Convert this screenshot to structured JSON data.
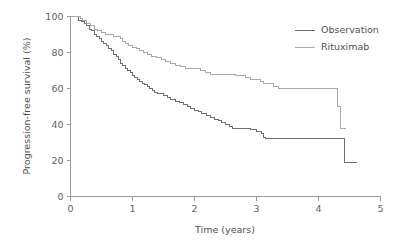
{
  "chart_data": {
    "type": "line",
    "subtype": "kaplan-meier-step",
    "title": "",
    "xlabel": "Time (years)",
    "ylabel": "Progression-free survival (%)",
    "xlim": [
      0,
      5
    ],
    "ylim": [
      0,
      100
    ],
    "xticks": [
      0,
      1,
      2,
      3,
      4,
      5
    ],
    "xtick_labels": [
      "0",
      "1",
      "2",
      "3",
      "4",
      "5"
    ],
    "yticks": [
      0,
      20,
      40,
      60,
      80,
      100
    ],
    "ytick_labels": [
      "0",
      "20",
      "40",
      "60",
      "80",
      "100"
    ],
    "grid": false,
    "legend_position": "top-right",
    "series": [
      {
        "name": "Observation",
        "color": "#6e6e6e",
        "final_value": 19,
        "points": [
          [
            0.0,
            100
          ],
          [
            0.1,
            100
          ],
          [
            0.13,
            98
          ],
          [
            0.18,
            97
          ],
          [
            0.22,
            96
          ],
          [
            0.26,
            95
          ],
          [
            0.3,
            93
          ],
          [
            0.34,
            92
          ],
          [
            0.38,
            90
          ],
          [
            0.42,
            89
          ],
          [
            0.46,
            88
          ],
          [
            0.5,
            86
          ],
          [
            0.54,
            85
          ],
          [
            0.58,
            84
          ],
          [
            0.62,
            82
          ],
          [
            0.66,
            81
          ],
          [
            0.7,
            79
          ],
          [
            0.74,
            78
          ],
          [
            0.78,
            76
          ],
          [
            0.8,
            74
          ],
          [
            0.84,
            73
          ],
          [
            0.88,
            71
          ],
          [
            0.92,
            70
          ],
          [
            0.96,
            69
          ],
          [
            1.0,
            67
          ],
          [
            1.04,
            66
          ],
          [
            1.08,
            65
          ],
          [
            1.12,
            64
          ],
          [
            1.16,
            63
          ],
          [
            1.2,
            62
          ],
          [
            1.24,
            61
          ],
          [
            1.28,
            60
          ],
          [
            1.32,
            59
          ],
          [
            1.36,
            58
          ],
          [
            1.4,
            57
          ],
          [
            1.5,
            56
          ],
          [
            1.56,
            55
          ],
          [
            1.62,
            54
          ],
          [
            1.7,
            53
          ],
          [
            1.76,
            52
          ],
          [
            1.82,
            51
          ],
          [
            1.88,
            50
          ],
          [
            1.94,
            49
          ],
          [
            2.0,
            48
          ],
          [
            2.06,
            47
          ],
          [
            2.12,
            46
          ],
          [
            2.2,
            45
          ],
          [
            2.26,
            44
          ],
          [
            2.32,
            43
          ],
          [
            2.38,
            42
          ],
          [
            2.44,
            41
          ],
          [
            2.5,
            40
          ],
          [
            2.56,
            39
          ],
          [
            2.62,
            38
          ],
          [
            2.8,
            38
          ],
          [
            2.9,
            37
          ],
          [
            3.0,
            36
          ],
          [
            3.08,
            35
          ],
          [
            3.12,
            33
          ],
          [
            3.15,
            32
          ],
          [
            4.3,
            32
          ],
          [
            4.4,
            32
          ],
          [
            4.42,
            19
          ],
          [
            4.62,
            19
          ]
        ]
      },
      {
        "name": "Rituximab",
        "color": "#a8a8a8",
        "final_value": 38,
        "points": [
          [
            0.0,
            100
          ],
          [
            0.12,
            100
          ],
          [
            0.16,
            99
          ],
          [
            0.2,
            98
          ],
          [
            0.26,
            96
          ],
          [
            0.32,
            95
          ],
          [
            0.38,
            93
          ],
          [
            0.44,
            92
          ],
          [
            0.5,
            91
          ],
          [
            0.56,
            90
          ],
          [
            0.62,
            90
          ],
          [
            0.7,
            89
          ],
          [
            0.76,
            89
          ],
          [
            0.8,
            88
          ],
          [
            0.84,
            86
          ],
          [
            0.88,
            85
          ],
          [
            0.94,
            84
          ],
          [
            1.0,
            83
          ],
          [
            1.06,
            82
          ],
          [
            1.12,
            81
          ],
          [
            1.18,
            80
          ],
          [
            1.24,
            79
          ],
          [
            1.3,
            78
          ],
          [
            1.38,
            77
          ],
          [
            1.46,
            76
          ],
          [
            1.54,
            75
          ],
          [
            1.62,
            74
          ],
          [
            1.7,
            73
          ],
          [
            1.78,
            72
          ],
          [
            1.86,
            71
          ],
          [
            2.0,
            71
          ],
          [
            2.1,
            70
          ],
          [
            2.18,
            69
          ],
          [
            2.26,
            68
          ],
          [
            2.6,
            68
          ],
          [
            2.66,
            67
          ],
          [
            2.74,
            67
          ],
          [
            2.82,
            66
          ],
          [
            2.9,
            65
          ],
          [
            3.0,
            65
          ],
          [
            3.06,
            64
          ],
          [
            3.12,
            63
          ],
          [
            3.2,
            63
          ],
          [
            3.28,
            61
          ],
          [
            3.36,
            60
          ],
          [
            4.28,
            60
          ],
          [
            4.3,
            50
          ],
          [
            4.34,
            50
          ],
          [
            4.36,
            38
          ],
          [
            4.44,
            38
          ]
        ]
      }
    ]
  },
  "legend": {
    "items": [
      {
        "label": "Observation",
        "color": "#6e6e6e"
      },
      {
        "label": "Rituximab",
        "color": "#a8a8a8"
      }
    ]
  },
  "axes": {
    "x_title": "Time (years)",
    "y_title": "Progression-free survival (%)"
  }
}
